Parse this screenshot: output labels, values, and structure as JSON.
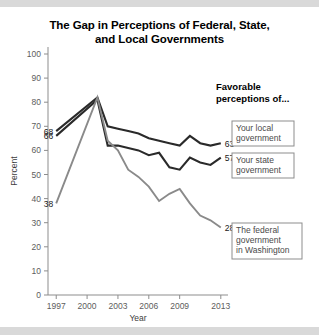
{
  "chart_data": {
    "type": "line",
    "title": "The Gap in Perceptions of Federal, State, and Local Governments",
    "title_line1": "The Gap in Perceptions of Federal, State,",
    "title_line2": "and Local Governments",
    "xlabel": "Year",
    "ylabel": "Percent",
    "ylim": [
      0,
      100
    ],
    "xlim": [
      1996,
      2014
    ],
    "ytick_labels": [
      "0",
      "10",
      "20",
      "30",
      "40",
      "50",
      "60",
      "70",
      "80",
      "90",
      "100"
    ],
    "yticks": [
      0,
      10,
      20,
      30,
      40,
      50,
      60,
      70,
      80,
      90,
      100
    ],
    "xtick_labels": [
      "1997",
      "2000",
      "2003",
      "2006",
      "2009",
      "2013"
    ],
    "xticks": [
      1997,
      2000,
      2003,
      2006,
      2009,
      2013
    ],
    "grid": false,
    "legend_position": "right",
    "legend_title_line1": "Favorable",
    "legend_title_line2": "perceptions of...",
    "series": [
      {
        "name": "Your local government",
        "color": "#2a2a2a",
        "start_label": "68",
        "end_label": "63",
        "legend_line1": "Your local",
        "legend_line2": "government",
        "x": [
          1997,
          2001,
          2002,
          2003,
          2004,
          2005,
          2006,
          2007,
          2008,
          2009,
          2010,
          2011,
          2012,
          2013
        ],
        "values": [
          68,
          82,
          70,
          69,
          68,
          67,
          65,
          64,
          63,
          62,
          66,
          63,
          62,
          63
        ]
      },
      {
        "name": "Your state government",
        "color": "#2a2a2a",
        "start_label": "66",
        "end_label": "57",
        "legend_line1": "Your state",
        "legend_line2": "government",
        "x": [
          1997,
          2001,
          2002,
          2003,
          2004,
          2005,
          2006,
          2007,
          2008,
          2009,
          2010,
          2011,
          2012,
          2013
        ],
        "values": [
          66,
          81,
          62,
          62,
          61,
          60,
          58,
          59,
          53,
          52,
          57,
          55,
          54,
          57
        ]
      },
      {
        "name": "The federal government in Washington",
        "color": "#8a8a8a",
        "start_label": "38",
        "end_label": "28",
        "legend_line1": "The federal",
        "legend_line2": "government",
        "legend_line3": "in Washington",
        "x": [
          1997,
          2001,
          2002,
          2003,
          2004,
          2005,
          2006,
          2007,
          2008,
          2009,
          2010,
          2011,
          2012,
          2013
        ],
        "values": [
          38,
          82,
          64,
          60,
          52,
          49,
          45,
          39,
          42,
          44,
          38,
          33,
          31,
          28
        ]
      }
    ]
  }
}
